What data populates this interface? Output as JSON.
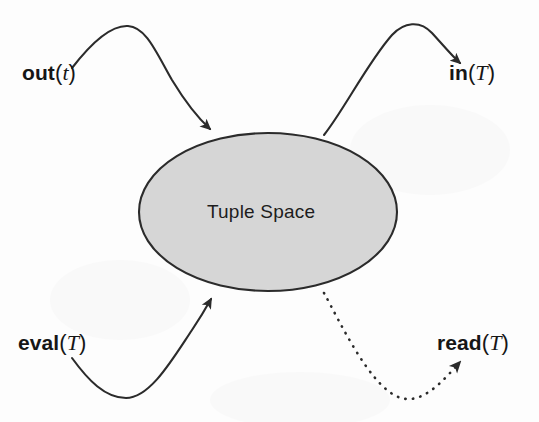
{
  "diagram": {
    "type": "concept-diagram",
    "title": "Tuple Space",
    "background_color": "#fdfdfd",
    "center_node": {
      "shape": "ellipse",
      "label": "Tuple Space",
      "fill_color": "#d6d6d6",
      "stroke_color": "#2b2b2b",
      "cx": 268,
      "cy": 212,
      "rx": 129,
      "ry": 79
    },
    "operations": [
      {
        "id": "out",
        "name": "out",
        "open_paren": "(",
        "arg": "t",
        "close_paren": ")",
        "direction": "into-tuple-space",
        "line_style": "solid",
        "position": "top-left"
      },
      {
        "id": "in",
        "name": "in",
        "open_paren": "(",
        "arg": "T",
        "close_paren": ")",
        "direction": "out-of-tuple-space",
        "line_style": "solid",
        "position": "top-right"
      },
      {
        "id": "eval",
        "name": "eval",
        "open_paren": "(",
        "arg": "T",
        "close_paren": ")",
        "direction": "into-tuple-space",
        "line_style": "solid",
        "position": "bottom-left"
      },
      {
        "id": "read",
        "name": "read",
        "open_paren": "(",
        "arg": "T",
        "close_paren": ")",
        "direction": "out-of-tuple-space",
        "line_style": "dotted",
        "position": "bottom-right"
      }
    ],
    "colors": {
      "stroke": "#2b2b2b",
      "text": "#161616",
      "node_fill": "#d6d6d6"
    }
  }
}
